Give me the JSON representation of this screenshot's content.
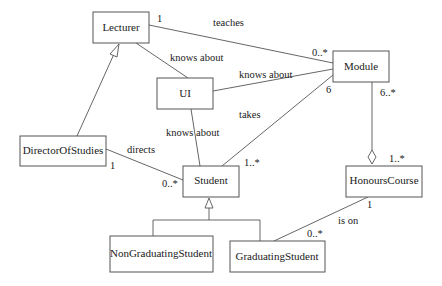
{
  "diagram": {
    "type": "UML class diagram",
    "classes": [
      {
        "id": "lecturer",
        "name": "Lecturer"
      },
      {
        "id": "ui",
        "name": "UI"
      },
      {
        "id": "module",
        "name": "Module"
      },
      {
        "id": "director",
        "name": "DirectorOfStudies"
      },
      {
        "id": "student",
        "name": "Student"
      },
      {
        "id": "honours",
        "name": "HonoursCourse"
      },
      {
        "id": "nongrad",
        "name": "NonGraduatingStudent"
      },
      {
        "id": "grad",
        "name": "GraduatingStudent"
      }
    ],
    "associations": [
      {
        "from": "Lecturer",
        "to": "Module",
        "label": "teaches",
        "from_mult": "1",
        "to_mult": "0..*"
      },
      {
        "from": "Lecturer",
        "to": "UI",
        "label": "knows about"
      },
      {
        "from": "UI",
        "to": "Module",
        "label": "knows about"
      },
      {
        "from": "UI",
        "to": "Student",
        "label": "knows about"
      },
      {
        "from": "Student",
        "to": "Module",
        "label": "takes",
        "from_mult": "1..*",
        "to_mult": "6"
      },
      {
        "from": "DirectorOfStudies",
        "to": "Student",
        "label": "directs",
        "from_mult": "1",
        "to_mult": "0..*"
      },
      {
        "from": "GraduatingStudent",
        "to": "HonoursCourse",
        "label": "is on",
        "from_mult": "0..*",
        "to_mult": "1"
      }
    ],
    "aggregations": [
      {
        "whole": "HonoursCourse",
        "part": "Module",
        "whole_mult": "1..*",
        "part_mult": "6..*"
      }
    ],
    "generalizations": [
      {
        "child": "DirectorOfStudies",
        "parent": "Lecturer"
      },
      {
        "child": "NonGraduatingStudent",
        "parent": "Student"
      },
      {
        "child": "GraduatingStudent",
        "parent": "Student"
      }
    ],
    "labels": {
      "teaches": "teaches",
      "knows_about_lecturer_ui": "knows about",
      "knows_about_ui_module": "knows about",
      "knows_about_ui_student": "knows about",
      "takes": "takes",
      "directs": "directs",
      "is_on": "is on"
    },
    "multiplicities": {
      "lecturer_teaches": "1",
      "module_teaches": "0..*",
      "module_takes": "6",
      "student_takes": "1..*",
      "module_agg": "6..*",
      "honours_agg": "1..*",
      "director_directs": "1",
      "student_directs": "0..*",
      "honours_is_on": "1",
      "grad_is_on": "0..*"
    }
  }
}
